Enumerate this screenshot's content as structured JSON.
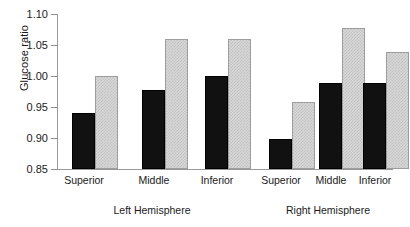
{
  "chart_data": {
    "type": "bar",
    "title": "",
    "xlabel": "",
    "ylabel": "Glucose ratio",
    "ylim": [
      0.85,
      1.1
    ],
    "ytick_labels": [
      "1.10",
      "1.05",
      "1.00",
      "0.95",
      "0.90",
      "0.85"
    ],
    "yticks": [
      1.1,
      1.05,
      1.0,
      0.95,
      0.9,
      0.85
    ],
    "grid": false,
    "legend": "none",
    "categories": [
      "Superior",
      "Middle",
      "Inferior"
    ],
    "groups": [
      {
        "name": "Left Hemisphere",
        "series": [
          {
            "name": "dark",
            "values": [
              0.94,
              0.978,
              1.0
            ]
          },
          {
            "name": "light",
            "values": [
              1.0,
              1.06,
              1.06
            ]
          }
        ]
      },
      {
        "name": "Right Hemisphere",
        "series": [
          {
            "name": "dark",
            "values": [
              0.898,
              0.989,
              0.989
            ]
          },
          {
            "name": "light",
            "values": [
              0.958,
              1.078,
              1.039
            ]
          }
        ]
      }
    ],
    "colors": {
      "dark_bar": "#111111",
      "light_bar": "#d7d7d7",
      "axis": "#9a9a9a",
      "text": "#1a1a1a",
      "background": "#ffffff"
    }
  },
  "axis": {
    "y_tick_0": "1.10",
    "y_tick_1": "1.05",
    "y_tick_2": "1.00",
    "y_tick_3": "0.95",
    "y_tick_4": "0.90",
    "y_tick_5": "0.85",
    "y_title": "Glucose ratio"
  },
  "labels": {
    "left_superior": "Superior",
    "left_middle": "Middle",
    "left_inferior": "Inferior",
    "right_superior": "Superior",
    "right_middle": "Middle",
    "right_inferior": "Inferior",
    "left_group": "Left Hemisphere",
    "right_group": "Right Hemisphere"
  }
}
